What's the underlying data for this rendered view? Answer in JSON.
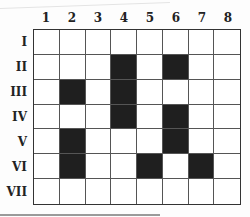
{
  "diagram": {
    "type": "grid",
    "columns": [
      "1",
      "2",
      "3",
      "4",
      "5",
      "6",
      "7",
      "8"
    ],
    "rows": [
      "I",
      "II",
      "III",
      "IV",
      "V",
      "VI",
      "VII"
    ],
    "filled_cells": [
      {
        "row": "II",
        "col": "4"
      },
      {
        "row": "II",
        "col": "6"
      },
      {
        "row": "III",
        "col": "2"
      },
      {
        "row": "III",
        "col": "4"
      },
      {
        "row": "IV",
        "col": "4"
      },
      {
        "row": "IV",
        "col": "6"
      },
      {
        "row": "V",
        "col": "2"
      },
      {
        "row": "V",
        "col": "6"
      },
      {
        "row": "VI",
        "col": "2"
      },
      {
        "row": "VI",
        "col": "5"
      },
      {
        "row": "VI",
        "col": "7"
      }
    ],
    "fill_color": "#1f1f1f",
    "empty_color": "#ffffff"
  }
}
